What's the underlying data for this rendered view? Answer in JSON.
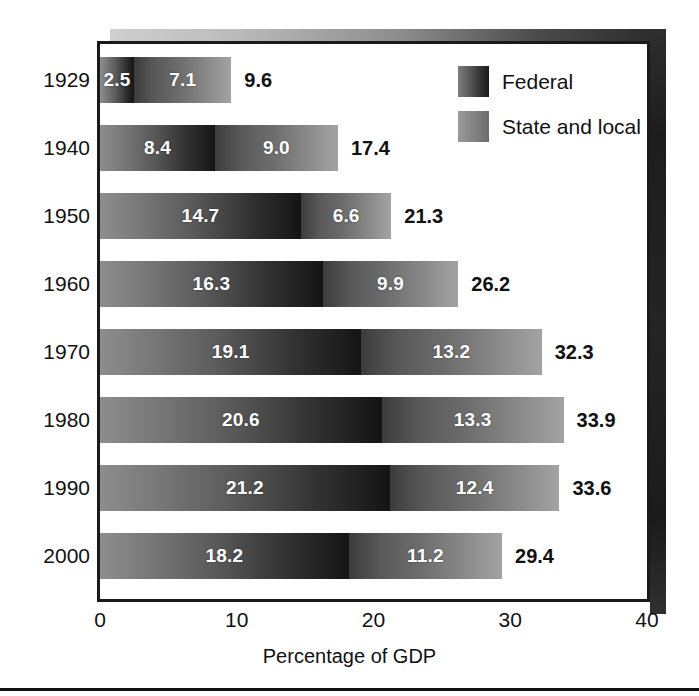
{
  "chart_data": {
    "type": "bar",
    "orientation": "horizontal",
    "stacked": true,
    "title": "",
    "xlabel": "Percentage of GDP",
    "ylabel": "",
    "xlim": [
      0,
      40
    ],
    "xticks": [
      "0",
      "10",
      "20",
      "30",
      "40"
    ],
    "grid": false,
    "legend_position": "top-right",
    "categories": [
      "1929",
      "1940",
      "1950",
      "1960",
      "1970",
      "1980",
      "1990",
      "2000"
    ],
    "series": [
      {
        "name": "Federal",
        "values": [
          2.5,
          8.4,
          14.7,
          16.3,
          19.1,
          20.6,
          21.2,
          18.2
        ],
        "labels": [
          "2.5",
          "8.4",
          "14.7",
          "16.3",
          "19.1",
          "20.6",
          "21.2",
          "18.2"
        ],
        "color": "#3a3a3a"
      },
      {
        "name": "State and local",
        "values": [
          7.1,
          9.0,
          6.6,
          9.9,
          13.2,
          13.3,
          12.4,
          11.2
        ],
        "labels": [
          "7.1",
          "9.0",
          "6.6",
          "9.9",
          "13.2",
          "13.3",
          "12.4",
          "11.2"
        ],
        "color": "#8a8a8a"
      }
    ],
    "totals": [
      9.6,
      17.4,
      21.3,
      26.2,
      32.3,
      33.9,
      33.6,
      29.4
    ],
    "total_labels": [
      "9.6",
      "17.4",
      "21.3",
      "26.2",
      "32.3",
      "33.9",
      "33.6",
      "29.4"
    ]
  },
  "legend": {
    "items": [
      {
        "label": "Federal",
        "swatch": "federal"
      },
      {
        "label": "State and local",
        "swatch": "state"
      }
    ]
  },
  "axis": {
    "x_title": "Percentage of GDP"
  }
}
